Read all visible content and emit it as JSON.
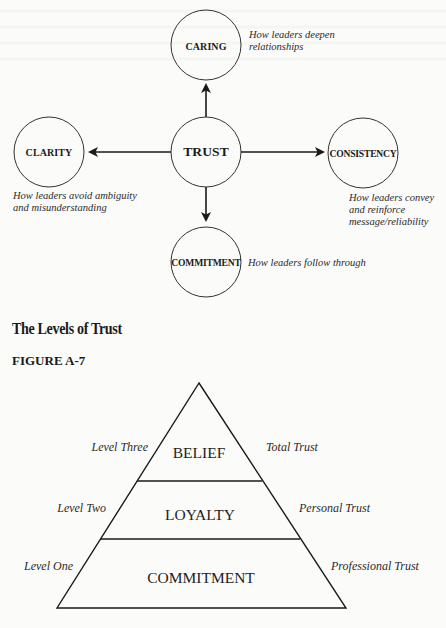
{
  "trust_diagram": {
    "nodes": {
      "center": {
        "label": "TRUST"
      },
      "top": {
        "label": "CARING",
        "caption": [
          "How leaders deepen",
          "relationships"
        ]
      },
      "left": {
        "label": "CLARITY",
        "caption": [
          "How leaders avoid ambiguity",
          "and misunderstanding"
        ]
      },
      "right": {
        "label": "CONSISTENCY",
        "caption": [
          "How leaders convey",
          "and reinforce",
          "message/reliability"
        ]
      },
      "bottom": {
        "label": "COMMITMENT",
        "caption": [
          "How leaders follow through"
        ]
      }
    }
  },
  "section": {
    "heading": "The Levels of Trust",
    "figure_label": "FIGURE A-7"
  },
  "pyramid": {
    "tiers": [
      {
        "label": "BELIEF",
        "level": "Level Three",
        "trust_type": "Total Trust"
      },
      {
        "label": "LOYALTY",
        "level": "Level Two",
        "trust_type": "Personal Trust"
      },
      {
        "label": "COMMITMENT",
        "level": "Level One",
        "trust_type": "Professional Trust"
      }
    ]
  },
  "colors": {
    "background": "#fbfbfa",
    "ink": "#1a1a1a"
  }
}
